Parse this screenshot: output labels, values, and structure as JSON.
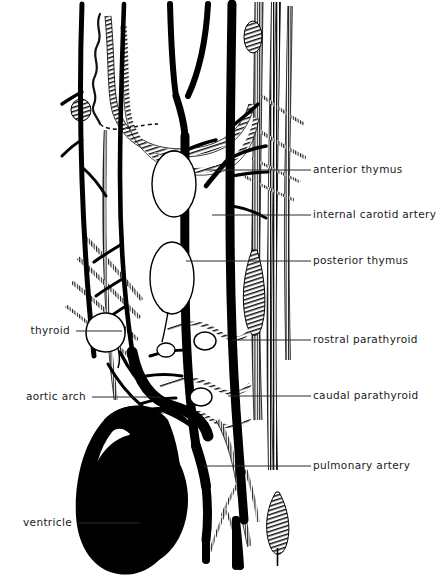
{
  "figure": {
    "type": "anatomical-diagram",
    "background_color": "#ffffff",
    "ink_color": "#000000",
    "label_color": "#1a1a1a"
  },
  "labels_right": [
    {
      "id": "anterior-thymus",
      "text": "anterior thymus",
      "text_x": 313,
      "text_y": 170,
      "leader_x1": 311,
      "leader_x2": 206,
      "leader_y": 170
    },
    {
      "id": "internal-carotid-artery",
      "text": "internal carotid artery",
      "text_x": 313,
      "text_y": 215,
      "leader_x1": 311,
      "leader_x2": 212,
      "leader_y": 215
    },
    {
      "id": "posterior-thymus",
      "text": "posterior thymus",
      "text_x": 313,
      "text_y": 261,
      "leader_x1": 311,
      "leader_x2": 186,
      "leader_y": 261
    },
    {
      "id": "rostral-parathyroid",
      "text": "rostral parathyroid",
      "text_x": 313,
      "text_y": 340,
      "leader_x1": 311,
      "leader_x2": 232,
      "leader_y": 340
    },
    {
      "id": "caudal-parathyroid",
      "text": "caudal parathyroid",
      "text_x": 313,
      "text_y": 396,
      "leader_x1": 311,
      "leader_x2": 228,
      "leader_y": 396
    },
    {
      "id": "pulmonary-artery",
      "text": "pulmonary artery",
      "text_x": 313,
      "text_y": 466,
      "leader_x1": 311,
      "leader_x2": 203,
      "leader_y": 466
    }
  ],
  "labels_left": [
    {
      "id": "thyroid",
      "text": "thyroid",
      "text_right_x": 70,
      "text_y": 331,
      "leader_x1": 76,
      "leader_x2": 122,
      "leader_y": 331
    },
    {
      "id": "aortic-arch",
      "text": "aortic arch",
      "text_right_x": 86,
      "text_y": 397,
      "leader_x1": 92,
      "leader_x2": 160,
      "leader_y": 397
    },
    {
      "id": "ventricle",
      "text": "ventricle",
      "text_right_x": 72,
      "text_y": 523,
      "leader_x1": 78,
      "leader_x2": 140,
      "leader_y": 523
    }
  ],
  "structures": {
    "ventricle": {
      "name": "ventricle",
      "fill": "solid-black",
      "highlight": "white-crescent"
    },
    "anterior_thymus_lobe": {
      "name": "anterior thymus lobe",
      "outline": "thin-black-oval"
    },
    "posterior_thymus_lobe": {
      "name": "posterior thymus lobe",
      "outline": "thin-black-oval"
    },
    "thyroid_gland": {
      "name": "thyroid gland",
      "outline": "thin-black-lobed"
    },
    "rostral_parathyroid_body": {
      "name": "rostral parathyroid",
      "outline": "small-oval"
    },
    "caudal_parathyroid_body": {
      "name": "caudal parathyroid",
      "outline": "small-oval"
    },
    "hatched_vessels": {
      "name": "veins and nerves",
      "style": "longitudinal-hatching"
    },
    "solid_vessels": {
      "name": "arteries",
      "style": "solid-black"
    },
    "ganglion_upper_right": {
      "name": "ganglion",
      "style": "hatched-nodule"
    },
    "ganglion_left": {
      "name": "ganglion",
      "style": "hatched-nodule"
    },
    "lower_hatched_body": {
      "name": "hatched leaf-shaped body",
      "style": "hatched"
    }
  }
}
